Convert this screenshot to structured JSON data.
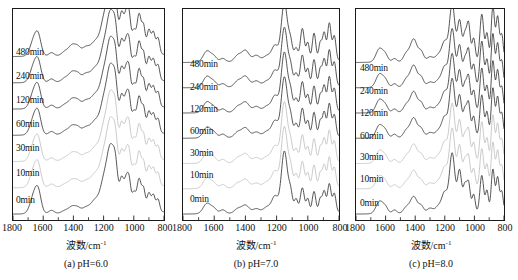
{
  "figure": {
    "axis_title_text": "波数",
    "axis_title_unit": "/cm",
    "axis_title_exponent": "-1"
  },
  "panels": [
    {
      "id": "a",
      "caption": "(a) pH=6.0",
      "ph": "6.0"
    },
    {
      "id": "b",
      "caption": "(b) pH=7.0",
      "ph": "7.0"
    },
    {
      "id": "c",
      "caption": "(c) pH=8.0",
      "ph": "8.0"
    }
  ],
  "series_labels": [
    "480min",
    "240min",
    "120min",
    "60min",
    "30min",
    "10min",
    "0min"
  ],
  "axis": {
    "ticks": [
      1800,
      1600,
      1400,
      1200,
      1000,
      800
    ],
    "tick_labels": [
      "1800",
      "1600",
      "1400",
      "1200",
      "1000",
      "800"
    ],
    "xmin": 800,
    "xmax": 1800,
    "reversed": true,
    "minor_ticks_per_interval": 1
  },
  "colors": {
    "dark_curve": "#2b2b2b",
    "light_curve": "#b8b8b8",
    "frame": "#1a1a1a",
    "text": "#111111",
    "background": "#ffffff"
  },
  "chart_data": {
    "type": "line",
    "title": "",
    "xlabel": "波数/cm-1",
    "ylabel": "",
    "xlim": [
      1800,
      800
    ],
    "x_axis_reversed": true,
    "grid": false,
    "legend": "inline-labels",
    "y_offset_stacked": true,
    "panels": [
      {
        "panel": "(a) pH=6.0",
        "series": [
          {
            "name": "0min",
            "color": "#2b2b2b",
            "peaks_cm1": [
              1650,
              1545,
              1400,
              1150,
              1080,
              1040,
              960,
              900,
              860
            ],
            "peak_rel_intensity": [
              0.3,
              0.1,
              0.12,
              1.0,
              0.6,
              0.55,
              0.5,
              0.35,
              0.3
            ],
            "x": [
              1800,
              1750,
              1700,
              1660,
              1640,
              1600,
              1560,
              1540,
              1500,
              1460,
              1420,
              1400,
              1380,
              1340,
              1300,
              1260,
              1220,
              1200,
              1180,
              1160,
              1150,
              1140,
              1120,
              1100,
              1080,
              1060,
              1040,
              1020,
              1000,
              980,
              960,
              940,
              920,
              900,
              880,
              860,
              840,
              820,
              800
            ],
            "y": [
              0.04,
              0.06,
              0.16,
              0.3,
              0.28,
              0.14,
              0.08,
              0.07,
              0.06,
              0.07,
              0.1,
              0.12,
              0.11,
              0.1,
              0.12,
              0.18,
              0.4,
              0.62,
              0.86,
              0.98,
              1.0,
              0.96,
              0.8,
              0.66,
              0.6,
              0.52,
              0.55,
              0.44,
              0.38,
              0.44,
              0.5,
              0.38,
              0.33,
              0.35,
              0.3,
              0.3,
              0.22,
              0.16,
              0.08
            ]
          },
          {
            "name": "10min",
            "color": "#b8b8b8",
            "peaks_cm1": [
              1650,
              1400,
              1150,
              1080,
              1040,
              960,
              900
            ],
            "peak_rel_intensity": [
              0.26,
              0.12,
              0.92,
              0.58,
              0.52,
              0.52,
              0.33
            ]
          },
          {
            "name": "30min",
            "color": "#b8b8b8",
            "peaks_cm1": [
              1650,
              1400,
              1150,
              1080,
              1040,
              960,
              900
            ],
            "peak_rel_intensity": [
              0.26,
              0.13,
              0.88,
              0.6,
              0.54,
              0.56,
              0.34
            ]
          },
          {
            "name": "60min",
            "color": "#2b2b2b",
            "peaks_cm1": [
              1650,
              1400,
              1150,
              1080,
              1040,
              960,
              900
            ],
            "peak_rel_intensity": [
              0.28,
              0.14,
              0.9,
              0.62,
              0.56,
              0.58,
              0.36
            ]
          },
          {
            "name": "120min",
            "color": "#2b2b2b",
            "peaks_cm1": [
              1650,
              1400,
              1150,
              1080,
              1040,
              960,
              900
            ],
            "peak_rel_intensity": [
              0.3,
              0.16,
              0.95,
              0.66,
              0.58,
              0.62,
              0.38
            ]
          },
          {
            "name": "240min",
            "color": "#2b2b2b",
            "peaks_cm1": [
              1650,
              1400,
              1150,
              1080,
              1040,
              960,
              900
            ],
            "peak_rel_intensity": [
              0.3,
              0.18,
              0.96,
              0.68,
              0.6,
              0.66,
              0.4
            ]
          },
          {
            "name": "480min",
            "color": "#2b2b2b",
            "peaks_cm1": [
              1650,
              1400,
              1150,
              1080,
              1040,
              960,
              900
            ],
            "peak_rel_intensity": [
              0.28,
              0.2,
              1.0,
              0.7,
              0.62,
              0.7,
              0.42
            ]
          }
        ]
      },
      {
        "panel": "(b) pH=7.0",
        "series": [
          {
            "name": "0min",
            "color": "#2b2b2b",
            "peaks_cm1": [
              1640,
              1400,
              1150,
              1030,
              960,
              900,
              860
            ],
            "peak_rel_intensity": [
              0.16,
              0.12,
              1.0,
              0.4,
              0.34,
              0.36,
              0.46
            ]
          },
          {
            "name": "10min",
            "color": "#b8b8b8",
            "peaks_cm1": [
              1640,
              1400,
              1150,
              1030,
              960,
              860
            ],
            "peak_rel_intensity": [
              0.16,
              0.12,
              0.95,
              0.4,
              0.34,
              0.46
            ]
          },
          {
            "name": "30min",
            "color": "#b8b8b8",
            "peaks_cm1": [
              1640,
              1400,
              1150,
              1030,
              960,
              860
            ],
            "peak_rel_intensity": [
              0.16,
              0.13,
              0.93,
              0.42,
              0.35,
              0.47
            ]
          },
          {
            "name": "60min",
            "color": "#2b2b2b",
            "peaks_cm1": [
              1640,
              1400,
              1150,
              1030,
              960,
              860
            ],
            "peak_rel_intensity": [
              0.17,
              0.14,
              0.96,
              0.44,
              0.36,
              0.48
            ]
          },
          {
            "name": "120min",
            "color": "#2b2b2b",
            "peaks_cm1": [
              1640,
              1400,
              1150,
              1030,
              960,
              860
            ],
            "peak_rel_intensity": [
              0.17,
              0.15,
              0.98,
              0.46,
              0.38,
              0.5
            ]
          },
          {
            "name": "240min",
            "color": "#2b2b2b",
            "peaks_cm1": [
              1640,
              1400,
              1150,
              1030,
              960,
              860
            ],
            "peak_rel_intensity": [
              0.18,
              0.16,
              1.0,
              0.48,
              0.4,
              0.52
            ]
          },
          {
            "name": "480min",
            "color": "#2b2b2b",
            "peaks_cm1": [
              1640,
              1400,
              1150,
              1030,
              960,
              860
            ],
            "peak_rel_intensity": [
              0.18,
              0.17,
              1.0,
              0.5,
              0.42,
              0.54
            ]
          }
        ]
      },
      {
        "panel": "(c) pH=8.0",
        "series": [
          {
            "name": "0min",
            "color": "#2b2b2b",
            "peaks_cm1": [
              1640,
              1410,
              1150,
              1100,
              1040,
              950,
              870,
              840
            ],
            "peak_rel_intensity": [
              0.2,
              0.26,
              1.0,
              0.7,
              0.5,
              0.62,
              0.72,
              0.6
            ]
          },
          {
            "name": "10min",
            "color": "#b8b8b8",
            "peaks_cm1": [
              1640,
              1410,
              1150,
              1100,
              1040,
              950,
              870
            ],
            "peak_rel_intensity": [
              0.2,
              0.26,
              0.96,
              0.68,
              0.5,
              0.62,
              0.7
            ]
          },
          {
            "name": "30min",
            "color": "#b8b8b8",
            "peaks_cm1": [
              1640,
              1410,
              1150,
              1100,
              1040,
              950,
              870
            ],
            "peak_rel_intensity": [
              0.21,
              0.27,
              0.95,
              0.68,
              0.52,
              0.63,
              0.7
            ]
          },
          {
            "name": "60min",
            "color": "#2b2b2b",
            "peaks_cm1": [
              1640,
              1410,
              1150,
              1100,
              1040,
              950,
              870
            ],
            "peak_rel_intensity": [
              0.22,
              0.28,
              0.96,
              0.7,
              0.54,
              0.64,
              0.72
            ]
          },
          {
            "name": "120min",
            "color": "#2b2b2b",
            "peaks_cm1": [
              1640,
              1410,
              1150,
              1100,
              1040,
              950,
              870
            ],
            "peak_rel_intensity": [
              0.22,
              0.3,
              0.98,
              0.72,
              0.56,
              0.66,
              0.74
            ]
          },
          {
            "name": "240min",
            "color": "#2b2b2b",
            "peaks_cm1": [
              1640,
              1410,
              1150,
              1100,
              1040,
              950,
              870
            ],
            "peak_rel_intensity": [
              0.23,
              0.31,
              1.0,
              0.74,
              0.58,
              0.68,
              0.76
            ]
          },
          {
            "name": "480min",
            "color": "#2b2b2b",
            "peaks_cm1": [
              1640,
              1410,
              1150,
              1100,
              1040,
              950,
              870
            ],
            "peak_rel_intensity": [
              0.23,
              0.32,
              1.0,
              0.76,
              0.6,
              0.7,
              0.78
            ]
          }
        ]
      }
    ]
  },
  "series_label_positions": {
    "a": [
      {
        "label": "480min",
        "left": 16,
        "top": 47
      },
      {
        "label": "240min",
        "left": 16,
        "top": 71
      },
      {
        "label": "120min",
        "left": 16,
        "top": 95
      },
      {
        "label": "60min",
        "left": 16,
        "top": 119
      },
      {
        "label": "30min",
        "left": 16,
        "top": 143
      },
      {
        "label": "10min",
        "left": 16,
        "top": 168
      },
      {
        "label": "0min",
        "left": 16,
        "top": 195
      }
    ],
    "b": [
      {
        "label": "480min",
        "left": 20,
        "top": 59
      },
      {
        "label": "240min",
        "left": 20,
        "top": 82
      },
      {
        "label": "120min",
        "left": 20,
        "top": 104
      },
      {
        "label": "60min",
        "left": 20,
        "top": 126
      },
      {
        "label": "30min",
        "left": 20,
        "top": 148
      },
      {
        "label": "10min",
        "left": 20,
        "top": 170
      },
      {
        "label": "0min",
        "left": 20,
        "top": 194
      }
    ],
    "c": [
      {
        "label": "480min",
        "left": 20,
        "top": 63
      },
      {
        "label": "240min",
        "left": 20,
        "top": 86
      },
      {
        "label": "120min",
        "left": 20,
        "top": 108
      },
      {
        "label": "60min",
        "left": 20,
        "top": 131
      },
      {
        "label": "30min",
        "left": 20,
        "top": 152
      },
      {
        "label": "10min",
        "left": 20,
        "top": 174
      },
      {
        "label": "0min",
        "left": 20,
        "top": 198
      }
    ]
  }
}
